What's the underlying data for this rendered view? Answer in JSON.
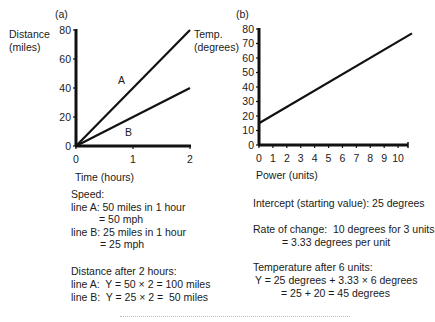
{
  "panel_a": {
    "tag": "(a)",
    "ylabel_line1": "Distance",
    "ylabel_line2": "(miles)",
    "xlabel": "Time (hours)",
    "line_labels": [
      "A",
      "B"
    ],
    "notes": {
      "speed_heading": "Speed:",
      "speed_a_1": "line A: 50 miles in 1 hour",
      "speed_a_2": "= 50 mph",
      "speed_b_1": "line B: 25 miles in 1 hour",
      "speed_b_2": "= 25 mph",
      "dist_heading": "Distance after 2 hours:",
      "dist_a": "line A:  Y = 50 × 2 = 100 miles",
      "dist_b": "line B:  Y = 25 × 2 =  50 miles"
    }
  },
  "panel_b": {
    "tag": "(b)",
    "ylabel_line1": "Temp.",
    "ylabel_line2": "(degrees)",
    "xlabel": "Power (units)",
    "notes": {
      "intercept": "Intercept (starting value): 25 degrees",
      "rate_1": "Rate of change:  10 degrees for 3 units",
      "rate_2": "= 3.33 degrees per unit",
      "temp_heading": "Temperature after 6 units:",
      "temp_1": "Y = 25 degrees + 3.33 × 6 degrees",
      "temp_2": "= 25 + 20 = 45 degrees"
    }
  },
  "chart_data": [
    {
      "type": "line",
      "title": "(a)",
      "xlabel": "Time (hours)",
      "ylabel": "Distance (miles)",
      "xlim": [
        0,
        2
      ],
      "ylim": [
        0,
        80
      ],
      "xticks": [
        0,
        1,
        2
      ],
      "yticks": [
        0,
        20,
        40,
        60,
        80
      ],
      "grid": false,
      "series": [
        {
          "name": "A",
          "x": [
            0,
            2
          ],
          "y": [
            0,
            80
          ]
        },
        {
          "name": "B",
          "x": [
            0,
            2
          ],
          "y": [
            0,
            40
          ]
        }
      ]
    },
    {
      "type": "line",
      "title": "(b)",
      "xlabel": "Power (units)",
      "ylabel": "Temp. (degrees)",
      "xlim": [
        0,
        11
      ],
      "ylim": [
        0,
        80
      ],
      "xticks": [
        0,
        1,
        2,
        3,
        4,
        5,
        6,
        7,
        8,
        9,
        10
      ],
      "yticks": [
        0,
        10,
        20,
        30,
        40,
        50,
        60,
        70,
        80
      ],
      "grid": false,
      "series": [
        {
          "name": "Temperature",
          "x": [
            0,
            11
          ],
          "y": [
            15,
            77
          ]
        }
      ]
    }
  ]
}
